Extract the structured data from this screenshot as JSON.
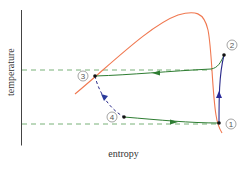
{
  "diagram": {
    "xlabel": "entropy",
    "ylabel": "temperature",
    "points": [
      {
        "id": "1",
        "label": "①",
        "x": 219,
        "y": 123
      },
      {
        "id": "2",
        "label": "②",
        "x": 224,
        "y": 55
      },
      {
        "id": "3",
        "label": "③",
        "x": 95,
        "y": 76
      },
      {
        "id": "4",
        "label": "④",
        "x": 124,
        "y": 117
      }
    ],
    "colors": {
      "saturation_dome": "#f07850",
      "process_green": "#2e7d32",
      "process_blue": "#2a2a8a",
      "dashed_guide": "#5a9a5a",
      "axis": "#333333"
    },
    "isotherms": [
      {
        "name": "high-temperature",
        "y": 70
      },
      {
        "name": "low-temperature",
        "y": 124
      }
    ]
  }
}
